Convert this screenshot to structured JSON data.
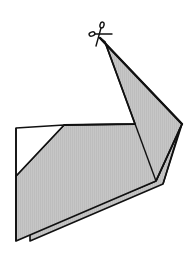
{
  "diagram": {
    "type": "origami-step",
    "colors": {
      "paper_shaded": "#c4c4c4",
      "paper_white": "#ffffff",
      "outline": "#111111",
      "background": "#ffffff"
    },
    "symbols": [
      {
        "name": "scissors-icon",
        "meaning": "cut",
        "position": [
          100,
          38
        ]
      }
    ]
  }
}
